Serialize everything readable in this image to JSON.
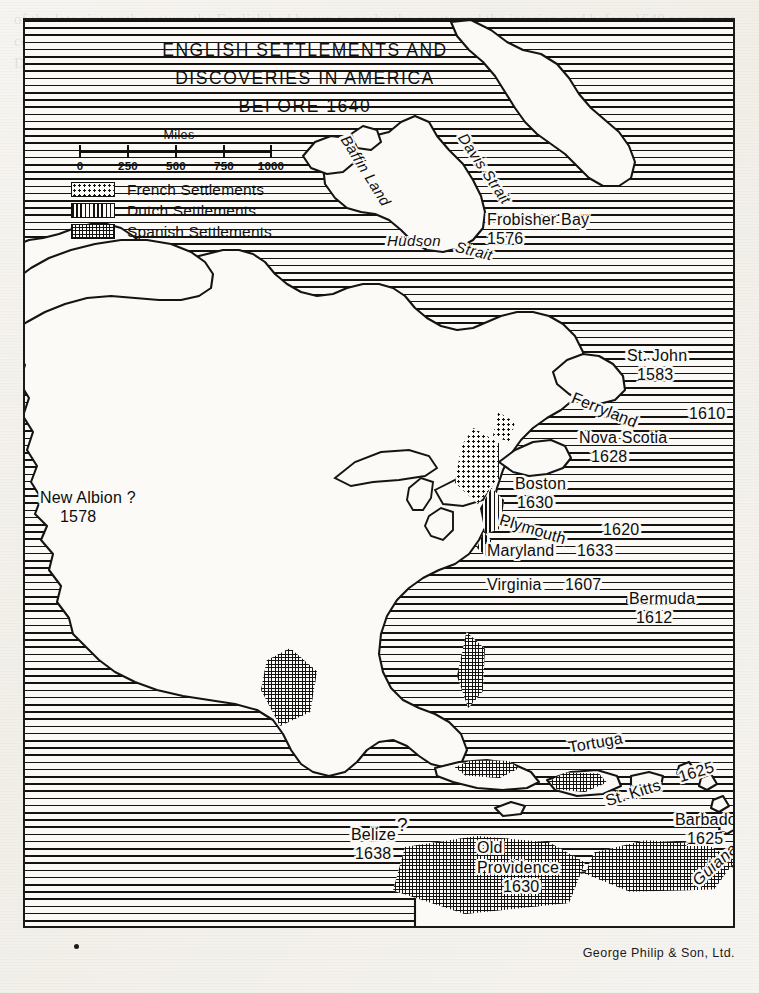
{
  "document": {
    "type": "historical-map",
    "credit": "George Philip & Son, Ltd.",
    "bleed_through_text": "of the late sixteenth century the English had begun to probe the coasts and the interior, and before 1640 permanent colonies had been planted from Newfoundland to the Caribbean, while the French held the St. Lawrence and the Dutch the Hudson."
  },
  "title": {
    "line1": "ENGLISH SETTLEMENTS AND",
    "line2": "DISCOVERIES IN AMERICA",
    "line3": "BEFORE 1640"
  },
  "scale": {
    "caption": "Miles",
    "ticks": [
      "0",
      "250",
      "500",
      "750",
      "1000"
    ],
    "unit": "miles",
    "max": 1000
  },
  "legend": {
    "items": [
      {
        "pattern": "french-dotted",
        "label": "French Settlements"
      },
      {
        "pattern": "dutch-vertical",
        "label": "Dutch Settlements"
      },
      {
        "pattern": "spanish-crosshatch",
        "label": "Spanish Settlements"
      }
    ]
  },
  "labels": {
    "geographic": [
      {
        "name": "baffin-land",
        "text": "Baffin Land"
      },
      {
        "name": "davis-strait",
        "text": "Davis Strait"
      },
      {
        "name": "hudson",
        "text": "Hudson"
      },
      {
        "name": "strait",
        "text": "Strait"
      },
      {
        "name": "guiana",
        "text": "Guiana"
      }
    ],
    "settlements": [
      {
        "name": "frobisher-bay",
        "place": "Frobisher Bay",
        "year": "1576"
      },
      {
        "name": "st-john",
        "place": "St. John",
        "year": "1583"
      },
      {
        "name": "ferryland",
        "place": "Ferryland",
        "year": "1610"
      },
      {
        "name": "nova-scotia",
        "place": "Nova Scotia",
        "year": "1628"
      },
      {
        "name": "boston",
        "place": "Boston",
        "year": "1630"
      },
      {
        "name": "plymouth",
        "place": "Plymouth",
        "year": "1620"
      },
      {
        "name": "maryland",
        "place": "Maryland",
        "year": "1633"
      },
      {
        "name": "virginia",
        "place": "Virginia",
        "year": "1607"
      },
      {
        "name": "bermuda",
        "place": "Bermuda",
        "year": "1612"
      },
      {
        "name": "new-albion",
        "place": "New Albion ?",
        "year": "1578"
      },
      {
        "name": "tortuga",
        "place": "Tortuga",
        "year": ""
      },
      {
        "name": "st-kitts",
        "place": "St. Kitts",
        "year": "1625"
      },
      {
        "name": "barbados",
        "place": "Barbados",
        "year": "1625"
      },
      {
        "name": "old-providence",
        "place": "Old Providence",
        "year": "1630"
      },
      {
        "name": "belize",
        "place": "Belize",
        "year": "1638",
        "marker": "?"
      }
    ]
  },
  "colors": {
    "ink": "#141414",
    "paper": "#fbfaf7",
    "page": "#f5f3ef"
  }
}
